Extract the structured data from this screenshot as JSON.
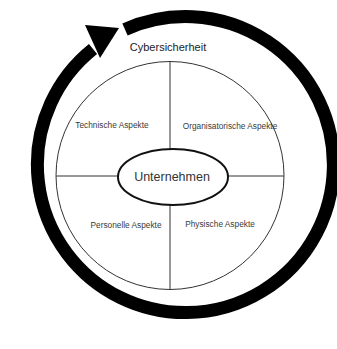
{
  "diagram": {
    "outer_label": "Cybersicherheit",
    "center_label": "Unternehmen",
    "quadrants": [
      {
        "position": "top-left",
        "label": "Technische Aspekte"
      },
      {
        "position": "top-right",
        "label": "Organisatorische Aspekte"
      },
      {
        "position": "bottom-left",
        "label": "Personelle Aspekte"
      },
      {
        "position": "bottom-right",
        "label": "Physische Aspekte"
      }
    ],
    "colors": {
      "ring": "#000000",
      "lines": "#333333",
      "text": "#333333",
      "background": "#ffffff"
    }
  }
}
